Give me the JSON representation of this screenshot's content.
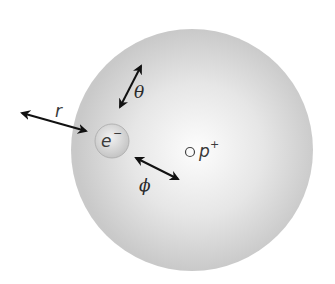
{
  "diagram": {
    "labels": {
      "radius": "r",
      "polar_angle": "θ",
      "azimuthal_angle": "ϕ",
      "electron": "e",
      "electron_charge": "−",
      "proton": "p",
      "proton_charge": "+"
    },
    "colors": {
      "cloud_center": "#ffffff",
      "cloud_edge": "#c8c8c8",
      "arrow": "#111111"
    }
  }
}
